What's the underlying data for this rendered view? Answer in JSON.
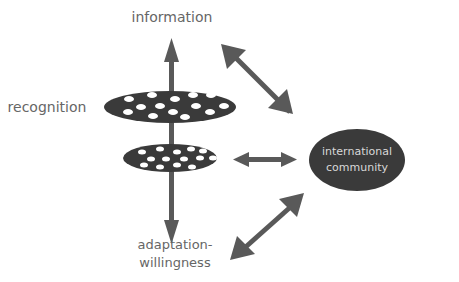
{
  "diagram": {
    "labels": {
      "top": "information",
      "left": "recognition",
      "bottom_line1": "adaptation-",
      "bottom_line2": "willingness"
    },
    "node": {
      "line1": "international",
      "line2": "community"
    },
    "colors": {
      "shape_fill": "#3a3a3a",
      "arrow_fill": "#595959",
      "text": "#666666",
      "node_text": "#d8d8d8",
      "background": "#ffffff"
    }
  }
}
